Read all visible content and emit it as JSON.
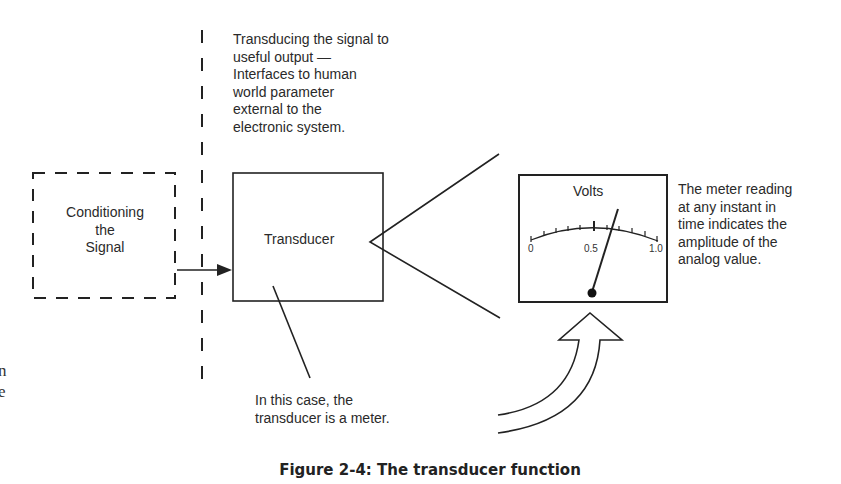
{
  "figure": {
    "caption": "Figure 2-4: The transducer function",
    "top_note": [
      "Transducing the signal to",
      "useful output —",
      "Interfaces to human",
      "world parameter",
      "external to the",
      "electronic system."
    ],
    "conditioning_box": [
      "Conditioning",
      "the",
      "Signal"
    ],
    "transducer_label": "Transducer",
    "bottom_note": [
      "In this case, the",
      "transducer is a meter."
    ],
    "meter": {
      "title": "Volts",
      "scale_labels": [
        "0",
        "0.5",
        "1.0"
      ],
      "needle_reading": 0.6
    },
    "meter_note": [
      "The meter reading",
      "at any instant in",
      "time indicates the",
      "amplitude of the",
      "analog value."
    ],
    "left_cut_text": [
      "n",
      "e"
    ]
  }
}
